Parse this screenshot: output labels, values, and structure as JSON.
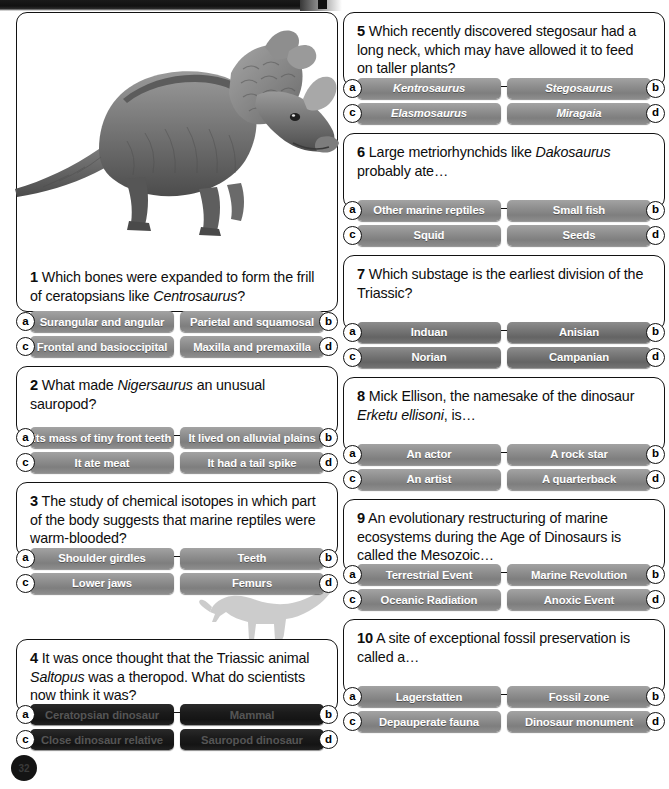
{
  "page": {
    "page_number": "32",
    "artwork_caption": "centrosaurus-illustration",
    "watermark": "hadrosaur-silhouette"
  },
  "questions": [
    {
      "number": "1",
      "text_html": "Which bones were expanded to form the frill of ceratopsians like <i>Centrosaurus</i>?",
      "style": "normal",
      "italic_answers": false,
      "answers": [
        {
          "letter": "a",
          "label": "Surangular and angular"
        },
        {
          "letter": "b",
          "label": "Parietal and squamosal"
        },
        {
          "letter": "c",
          "label": "Frontal and basioccipital"
        },
        {
          "letter": "d",
          "label": "Maxilla and premaxilla"
        }
      ]
    },
    {
      "number": "2",
      "text_html": "What made <i>Nigersaurus</i> an unusual sauropod?",
      "style": "normal",
      "italic_answers": false,
      "answers": [
        {
          "letter": "a",
          "label": "Its mass of tiny front teeth"
        },
        {
          "letter": "b",
          "label": "It lived on alluvial plains"
        },
        {
          "letter": "c",
          "label": "It ate meat"
        },
        {
          "letter": "d",
          "label": "It had a tail spike"
        }
      ]
    },
    {
      "number": "3",
      "text_html": "The study of chemical isotopes in which part of the body suggests that marine reptiles were warm-blooded?",
      "style": "normal",
      "italic_answers": false,
      "answers": [
        {
          "letter": "a",
          "label": "Shoulder girdles"
        },
        {
          "letter": "b",
          "label": "Teeth"
        },
        {
          "letter": "c",
          "label": "Lower jaws"
        },
        {
          "letter": "d",
          "label": "Femurs"
        }
      ]
    },
    {
      "number": "4",
      "text_html": "It was once thought that the Triassic animal <i>Saltopus</i> was a theropod. What do scientists now think it was?",
      "style": "black",
      "italic_answers": false,
      "answers": [
        {
          "letter": "a",
          "label": "Ceratopsian dinosaur"
        },
        {
          "letter": "b",
          "label": "Mammal"
        },
        {
          "letter": "c",
          "label": "Close dinosaur relative"
        },
        {
          "letter": "d",
          "label": "Sauropod dinosaur"
        }
      ]
    },
    {
      "number": "5",
      "text_html": "Which recently discovered stegosaur had a long neck, which may have allowed it to feed on taller plants?",
      "style": "normal",
      "italic_answers": true,
      "answers": [
        {
          "letter": "a",
          "label": "Kentrosaurus"
        },
        {
          "letter": "b",
          "label": "Stegosaurus"
        },
        {
          "letter": "c",
          "label": "Elasmosaurus"
        },
        {
          "letter": "d",
          "label": "Miragaia"
        }
      ]
    },
    {
      "number": "6",
      "text_html": "Large metriorhynchids like <i>Dakosaurus</i> probably ate…",
      "style": "normal",
      "italic_answers": false,
      "answers": [
        {
          "letter": "a",
          "label": "Other marine reptiles"
        },
        {
          "letter": "b",
          "label": "Small fish"
        },
        {
          "letter": "c",
          "label": "Squid"
        },
        {
          "letter": "d",
          "label": "Seeds"
        }
      ]
    },
    {
      "number": "7",
      "text_html": "Which substage is the earliest division of the Triassic?",
      "style": "dark",
      "italic_answers": false,
      "answers": [
        {
          "letter": "a",
          "label": "Induan"
        },
        {
          "letter": "b",
          "label": "Anisian"
        },
        {
          "letter": "c",
          "label": "Norian"
        },
        {
          "letter": "d",
          "label": "Campanian"
        }
      ]
    },
    {
      "number": "8",
      "text_html": "Mick Ellison, the namesake of the dinosaur <i>Erketu ellisoni</i>, is…",
      "style": "normal",
      "italic_answers": false,
      "answers": [
        {
          "letter": "a",
          "label": "An actor"
        },
        {
          "letter": "b",
          "label": "A rock star"
        },
        {
          "letter": "c",
          "label": "An artist"
        },
        {
          "letter": "d",
          "label": "A quarterback"
        }
      ]
    },
    {
      "number": "9",
      "text_html": "An evolutionary restructuring of marine ecosystems during the Age of Dinosaurs is called the Mesozoic…",
      "style": "normal",
      "italic_answers": false,
      "answers": [
        {
          "letter": "a",
          "label": "Terrestrial Event"
        },
        {
          "letter": "b",
          "label": "Marine Revolution"
        },
        {
          "letter": "c",
          "label": "Oceanic Radiation"
        },
        {
          "letter": "d",
          "label": "Anoxic Event"
        }
      ]
    },
    {
      "number": "10",
      "text_html": "A site of exceptional fossil preservation is called a…",
      "style": "normal",
      "italic_answers": false,
      "answers": [
        {
          "letter": "a",
          "label": "Lagerstatten"
        },
        {
          "letter": "b",
          "label": "Fossil zone"
        },
        {
          "letter": "c",
          "label": "Depauperate fauna"
        },
        {
          "letter": "d",
          "label": "Dinosaur monument"
        }
      ]
    }
  ],
  "colors": {
    "button_gray": "#8f8f8f",
    "button_dark": "#6f6f6f",
    "button_black": "#1b1b1b",
    "border": "#121212",
    "text": "#0d0d0d",
    "watermark": "#c9c9c9"
  }
}
